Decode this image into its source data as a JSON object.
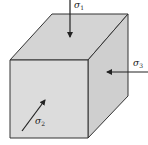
{
  "diagram": {
    "type": "stress-cube",
    "colors": {
      "front_face": "#dcdcdc",
      "top_face": "#d4d4d4",
      "right_face": "#cfcfcf",
      "edges": "#333333",
      "arrows": "#222222",
      "background": "#ffffff"
    },
    "labels": {
      "sigma1": {
        "symbol": "σ",
        "subscript": "1"
      },
      "sigma2": {
        "symbol": "σ",
        "subscript": "2"
      },
      "sigma3": {
        "symbol": "σ",
        "subscript": "3"
      }
    }
  }
}
